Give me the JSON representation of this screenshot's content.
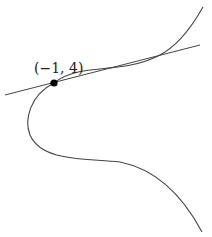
{
  "diagram": {
    "point": {
      "label": "(−1, 4)",
      "x": -1,
      "y": 4,
      "px": 54,
      "py": 83,
      "color": "#000000"
    },
    "tangent_line": {
      "x1": 5,
      "y1": 95,
      "x2": 200,
      "y2": 45,
      "color": "#444444"
    },
    "curve": {
      "path": "M203,7 C190,30 175,48 158,56 C120,75 80,62 54,83 C30,95 24,120 30,135 C42,162 85,158 120,162 C160,170 185,200 202,232",
      "color": "#444444"
    },
    "colors": {
      "background": "#ffffff",
      "stroke": "#444444",
      "text": "#222222"
    }
  }
}
